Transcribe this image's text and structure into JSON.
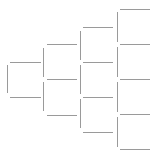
{
  "diagram": {
    "type": "bracket-tree",
    "line_color": "#9a9a9a",
    "background": "#ffffff",
    "columns": [
      {
        "index": 0,
        "verticals": [
          {
            "x": 7,
            "y1": 65,
            "y2": 93
          }
        ],
        "horizontals": [
          {
            "y": 62,
            "x1": 10,
            "x2": 41
          },
          {
            "y": 97,
            "x1": 10,
            "x2": 41
          }
        ]
      },
      {
        "index": 1,
        "verticals": [
          {
            "x": 43,
            "y1": 48,
            "y2": 77
          },
          {
            "x": 43,
            "y1": 82,
            "y2": 111
          }
        ],
        "horizontals": [
          {
            "y": 44,
            "x1": 47,
            "x2": 77
          },
          {
            "y": 79,
            "x1": 47,
            "x2": 77
          },
          {
            "y": 115,
            "x1": 47,
            "x2": 77
          }
        ]
      },
      {
        "index": 2,
        "verticals": [
          {
            "x": 80,
            "y1": 31,
            "y2": 60
          },
          {
            "x": 80,
            "y1": 65,
            "y2": 94
          },
          {
            "x": 80,
            "y1": 99,
            "y2": 128
          }
        ],
        "horizontals": [
          {
            "y": 27,
            "x1": 83,
            "x2": 113
          },
          {
            "y": 62,
            "x1": 83,
            "x2": 113
          },
          {
            "y": 97,
            "x1": 83,
            "x2": 113
          },
          {
            "y": 132,
            "x1": 83,
            "x2": 113
          }
        ]
      },
      {
        "index": 3,
        "verticals": [
          {
            "x": 117,
            "y1": 12,
            "y2": 42
          },
          {
            "x": 117,
            "y1": 47,
            "y2": 77
          },
          {
            "x": 117,
            "y1": 82,
            "y2": 112
          },
          {
            "x": 117,
            "y1": 117,
            "y2": 147
          }
        ],
        "horizontals": [
          {
            "y": 9,
            "x1": 120,
            "x2": 150
          },
          {
            "y": 44,
            "x1": 120,
            "x2": 150
          },
          {
            "y": 79,
            "x1": 120,
            "x2": 150
          },
          {
            "y": 114,
            "x1": 120,
            "x2": 150
          },
          {
            "y": 149,
            "x1": 120,
            "x2": 150
          }
        ]
      }
    ]
  }
}
